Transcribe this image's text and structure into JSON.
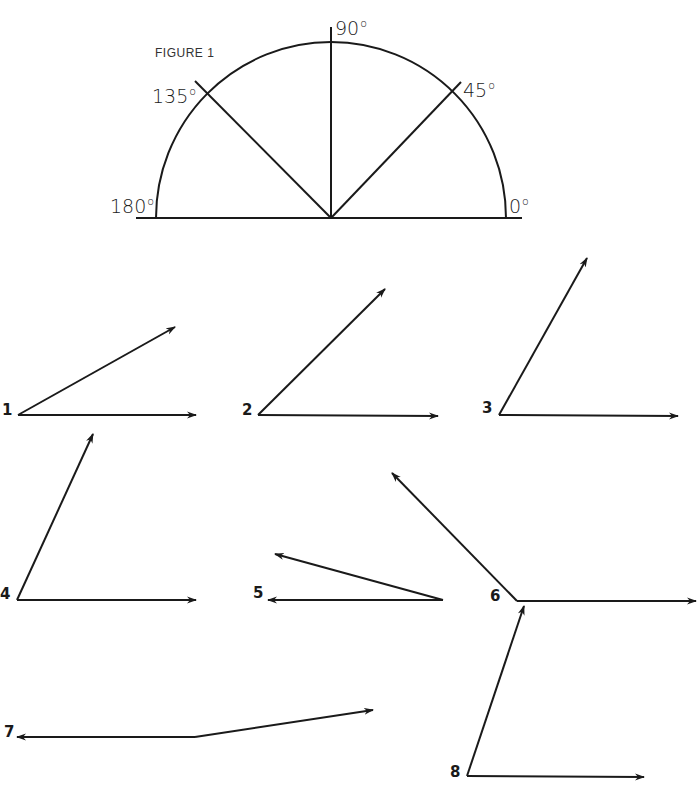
{
  "figure": {
    "title": "FIGURE 1",
    "protractor": {
      "labels": [
        {
          "value": "180",
          "unit": "o"
        },
        {
          "value": "135",
          "unit": "o"
        },
        {
          "value": "90",
          "unit": "o"
        },
        {
          "value": "45",
          "unit": "o"
        },
        {
          "value": "0",
          "unit": "o"
        }
      ]
    }
  },
  "angles": [
    {
      "label": "1"
    },
    {
      "label": "2"
    },
    {
      "label": "3"
    },
    {
      "label": "4"
    },
    {
      "label": "5"
    },
    {
      "label": "6"
    },
    {
      "label": "7"
    },
    {
      "label": "8"
    }
  ],
  "colors": {
    "ink": "#1a1a1a",
    "background": "#ffffff"
  }
}
